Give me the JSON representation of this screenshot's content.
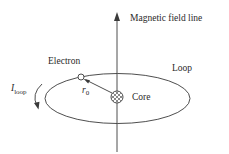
{
  "diagram": {
    "labels": {
      "field_line": "Magnetic field line",
      "electron": "Electron",
      "loop": "Loop",
      "core": "Core",
      "radius_main": "r",
      "radius_sub": "0",
      "current_main": "I",
      "current_sub": "loop"
    },
    "colors": {
      "stroke": "#3a3a3a",
      "text": "#2a2a2a",
      "background": "#ffffff"
    },
    "geometry": {
      "axis": {
        "x": 117,
        "y_top": 13,
        "y_bottom": 152
      },
      "loop_ellipse": {
        "cx": 117.5,
        "cy": 98.5,
        "rx": 72.5,
        "ry": 25
      },
      "electron": {
        "cx": 81,
        "cy": 77,
        "r": 3
      },
      "core": {
        "cx": 117,
        "cy": 97,
        "r": 6
      }
    }
  }
}
